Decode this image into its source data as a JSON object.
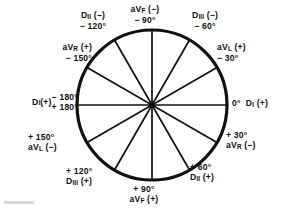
{
  "figure": {
    "type": "hexaxial-reference-circle",
    "line_color": "#111111",
    "background_color": "#ffffff",
    "center_x": 152,
    "center_y": 105,
    "radius": 75,
    "spoke_count": 12,
    "spoke_angles_deg": [
      0,
      30,
      60,
      90,
      120,
      150,
      180,
      210,
      240,
      270,
      300,
      330
    ]
  },
  "labels": {
    "top_center": {
      "lead": "aV",
      "lead_sub": "F",
      "polarity": "(−)",
      "angle": "− 90°"
    },
    "top_left": {
      "lead": "D",
      "lead_sub": "II",
      "polarity": "(−)",
      "angle": "− 120°"
    },
    "top_right": {
      "lead": "D",
      "lead_sub": "III",
      "polarity": "(−)",
      "angle": "− 60°"
    },
    "upper_left": {
      "lead": "aV",
      "lead_sub": "R",
      "polarity": "(+)",
      "angle": "− 150°"
    },
    "upper_right": {
      "lead": "aV",
      "lead_sub": "L",
      "polarity": "(+)",
      "angle": "− 30°"
    },
    "left_center": {
      "lead": "D",
      "lead_sub": "I",
      "polarity": "(+)",
      "angle_top": "− 180°",
      "angle_bottom": "+ 180°"
    },
    "right_center": {
      "lead": "D",
      "lead_sub": "I",
      "polarity": "(+)",
      "angle": "0°"
    },
    "lower_right": {
      "lead": "aV",
      "lead_sub": "R",
      "polarity": "(−)",
      "angle": "+ 30°"
    },
    "lower_right_2": {
      "lead": "D",
      "lead_sub": "II",
      "polarity": "(+)",
      "angle": "+ 60°"
    },
    "lower_left": {
      "lead": "aV",
      "lead_sub": "L",
      "polarity": "(−)",
      "angle": "+ 150°"
    },
    "lower_left_2": {
      "lead": "D",
      "lead_sub": "III",
      "polarity": "(+)",
      "angle": "+ 120°"
    },
    "bottom_center": {
      "lead": "aV",
      "lead_sub": "F",
      "polarity": "(+)",
      "angle": "+ 90°"
    }
  }
}
